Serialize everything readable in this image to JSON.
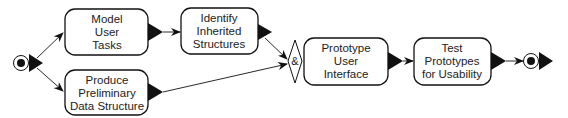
{
  "diagram": {
    "type": "activity-flow",
    "nodes": {
      "model_user_tasks": {
        "lines": [
          "Model",
          "User",
          "Tasks"
        ]
      },
      "produce_preliminary": {
        "lines": [
          "Produce",
          "Preliminary",
          "Data Structure"
        ]
      },
      "identify_inherited": {
        "lines": [
          "Identify",
          "Inherited",
          "Structures"
        ]
      },
      "join": {
        "label": "&"
      },
      "prototype_ui": {
        "lines": [
          "Prototype",
          "User",
          "Interface"
        ]
      },
      "test_prototypes": {
        "lines": [
          "Test",
          "Prototypes",
          "for Usability"
        ]
      }
    },
    "edges": [
      {
        "from": "start",
        "to": "model_user_tasks"
      },
      {
        "from": "start",
        "to": "produce_preliminary"
      },
      {
        "from": "model_user_tasks",
        "to": "identify_inherited"
      },
      {
        "from": "identify_inherited",
        "to": "join"
      },
      {
        "from": "produce_preliminary",
        "to": "join"
      },
      {
        "from": "join",
        "to": "prototype_ui"
      },
      {
        "from": "prototype_ui",
        "to": "test_prototypes"
      },
      {
        "from": "test_prototypes",
        "to": "end"
      }
    ],
    "colors": {
      "stroke": "#111111",
      "fill": "#ffffff",
      "text": "#222222"
    }
  }
}
